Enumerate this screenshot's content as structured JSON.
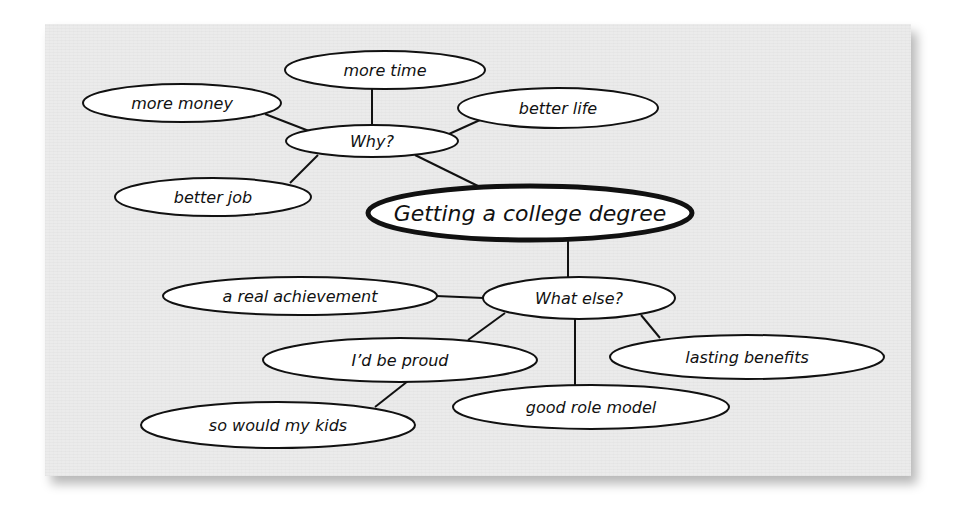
{
  "diagram": {
    "type": "cluster-map",
    "central_topic": "Getting a college degree",
    "colors": {
      "panel_background": "#ebebeb",
      "node_fill": "#ffffff",
      "stroke": "#111111"
    },
    "nodes": {
      "main": {
        "label": "Getting a college degree",
        "cx": 530,
        "cy": 213,
        "rx": 163,
        "ry": 28
      },
      "why": {
        "label": "Why?",
        "cx": 372,
        "cy": 141,
        "rx": 86,
        "ry": 16
      },
      "more_time": {
        "label": "more time",
        "cx": 385,
        "cy": 70,
        "rx": 100,
        "ry": 19
      },
      "more_money": {
        "label": "more money",
        "cx": 182,
        "cy": 103,
        "rx": 99,
        "ry": 19
      },
      "better_life": {
        "label": "better life",
        "cx": 558,
        "cy": 108,
        "rx": 100,
        "ry": 20
      },
      "better_job": {
        "label": "better job",
        "cx": 213,
        "cy": 197,
        "rx": 98,
        "ry": 19
      },
      "what_else": {
        "label": "What else?",
        "cx": 579,
        "cy": 298,
        "rx": 96,
        "ry": 21
      },
      "real_achievement": {
        "label": "a real achievement",
        "cx": 300,
        "cy": 296,
        "rx": 137,
        "ry": 19
      },
      "proud": {
        "label": "I’d be proud",
        "cx": 400,
        "cy": 360,
        "rx": 137,
        "ry": 22
      },
      "kids": {
        "label": "so would my kids",
        "cx": 278,
        "cy": 425,
        "rx": 137,
        "ry": 23
      },
      "role_model": {
        "label": "good role model",
        "cx": 591,
        "cy": 407,
        "rx": 138,
        "ry": 22
      },
      "lasting": {
        "label": "lasting benefits",
        "cx": 747,
        "cy": 357,
        "rx": 137,
        "ry": 22
      }
    },
    "edges": [
      {
        "from": "why",
        "to": "main"
      },
      {
        "from": "why",
        "to": "more_time"
      },
      {
        "from": "why",
        "to": "more_money"
      },
      {
        "from": "why",
        "to": "better_life"
      },
      {
        "from": "why",
        "to": "better_job"
      },
      {
        "from": "main",
        "to": "what_else"
      },
      {
        "from": "what_else",
        "to": "real_achievement"
      },
      {
        "from": "what_else",
        "to": "proud"
      },
      {
        "from": "proud",
        "to": "kids"
      },
      {
        "from": "what_else",
        "to": "role_model"
      },
      {
        "from": "what_else",
        "to": "lasting"
      }
    ]
  }
}
